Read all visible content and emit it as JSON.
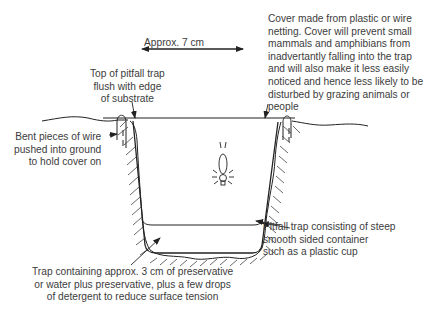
{
  "diagram": {
    "type": "pitfall-trap-cross-section",
    "labels": {
      "width_dimension": "Approx. 7 cm",
      "top_of_trap": "Top of pitfall trap\nflush with edge\nof substrate",
      "cover": "Cover made from plastic or wire\nnetting. Cover will prevent small\nmammals and amphibians from\ninadvertantly falling into the trap\nand will also make it less easily\nnoticed and hence less likely to be\ndisturbed by grazing animals or\npeople",
      "wire": "Bent pieces of wire\npushed into ground\nto hold cover on",
      "container": "Pitfall trap consisting of steep\nsmooth sided container\nsuch as a plastic cup",
      "preservative": "Trap containing approx. 3 cm of preservative\nor water plus preservative, plus a few drops\nof detergent to reduce surface tension"
    },
    "line_color": "#222222",
    "text_color": "#3c3c3c"
  }
}
